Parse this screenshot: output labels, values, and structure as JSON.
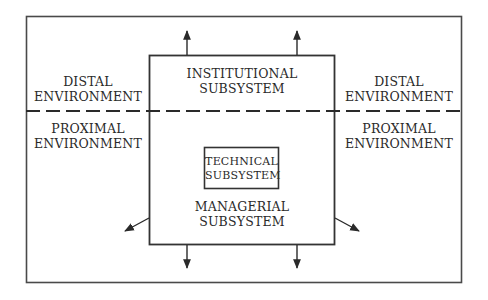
{
  "diagram": {
    "colors": {
      "line": "#3a3a3a",
      "text": "#2a2a2a",
      "background": "#ffffff"
    },
    "regions": {
      "distal_left": {
        "line1": "DISTAL",
        "line2": "ENVIRONMENT"
      },
      "distal_right": {
        "line1": "DISTAL",
        "line2": "ENVIRONMENT"
      },
      "proximal_left": {
        "line1": "PROXIMAL",
        "line2": "ENVIRONMENT"
      },
      "proximal_right": {
        "line1": "PROXIMAL",
        "line2": "ENVIRONMENT"
      }
    },
    "subsystems": {
      "institutional": {
        "line1": "INSTITUTIONAL",
        "line2": "SUBSYSTEM"
      },
      "technical": {
        "line1": "TECHNICAL",
        "line2": "SUBSYSTEM"
      },
      "managerial": {
        "line1": "MANAGERIAL",
        "line2": "SUBSYSTEM"
      }
    },
    "boundary": {
      "style": "dashed",
      "separates": [
        "DISTAL ENVIRONMENT",
        "PROXIMAL ENVIRONMENT"
      ]
    },
    "arrows": [
      {
        "id": "up-left",
        "direction": "up"
      },
      {
        "id": "up-right",
        "direction": "up"
      },
      {
        "id": "down-left",
        "direction": "down"
      },
      {
        "id": "down-right",
        "direction": "down"
      },
      {
        "id": "diag-left",
        "direction": "down-left"
      },
      {
        "id": "diag-right",
        "direction": "down-right"
      }
    ]
  }
}
